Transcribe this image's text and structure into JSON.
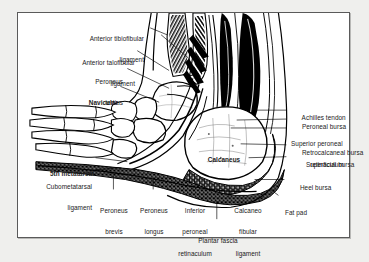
{
  "figure": {
    "frame_color": "#5a5a5a",
    "background_color": "#ffffff",
    "page_background": "#efefed",
    "ink_color": "#000000"
  },
  "labels": {
    "left": [
      {
        "id": "anterior-tibiofibular-ligament",
        "line1": "Anterior tibiofibular",
        "line2": "ligament",
        "bold": false
      },
      {
        "id": "anterior-talofibular-ligament",
        "line1": "Anterior talofibular",
        "line2": "ligament",
        "bold": false
      },
      {
        "id": "peroneus-tertius",
        "line1": "Peroneus",
        "line2": "tertius",
        "bold": false
      },
      {
        "id": "navicular",
        "line1": "Navicular",
        "line2": "",
        "bold": true
      },
      {
        "id": "fifth-metatarsal",
        "line1": "5th metatarsal",
        "line2": "",
        "bold": true
      },
      {
        "id": "cubometatarsal-ligament",
        "line1": "Cubometatarsal",
        "line2": "ligament",
        "bold": false
      }
    ],
    "right": [
      {
        "id": "achilles-tendon",
        "text": "Achilles tendon"
      },
      {
        "id": "peroneal-bursa",
        "text": "Peroneal bursa"
      },
      {
        "id": "superior-peroneal-retinaculum-1",
        "text": "Superior peroneal"
      },
      {
        "id": "superior-peroneal-retinaculum-2",
        "text": "retinaculum"
      },
      {
        "id": "retrocalcaneal-bursa",
        "text": "Retrocalcaneal bursa"
      },
      {
        "id": "superficial-bursa",
        "text": "Superficial bursa"
      },
      {
        "id": "heel-bursa",
        "text": "Heel bursa"
      }
    ],
    "interior": [
      {
        "id": "calcaneus",
        "text": "Calcaneus",
        "bold": true
      }
    ],
    "bottom": [
      {
        "id": "peroneus-brevis",
        "line1": "Peroneus",
        "line2": "brevis",
        "line3": ""
      },
      {
        "id": "peroneus-longus",
        "line1": "Peroneus",
        "line2": "longus",
        "line3": ""
      },
      {
        "id": "inferior-peroneal-retinaculum",
        "line1": "Inferior",
        "line2": "peroneal",
        "line3": "retinaculum"
      },
      {
        "id": "calcaneofibular-ligament",
        "line1": "Calcaneo",
        "line2": "fibular",
        "line3": "ligament"
      },
      {
        "id": "fat-pad",
        "line1": "Fat pad",
        "line2": "",
        "line3": ""
      },
      {
        "id": "plantar-fascia",
        "line1": "Plantar fascia",
        "line2": "",
        "line3": ""
      }
    ]
  }
}
